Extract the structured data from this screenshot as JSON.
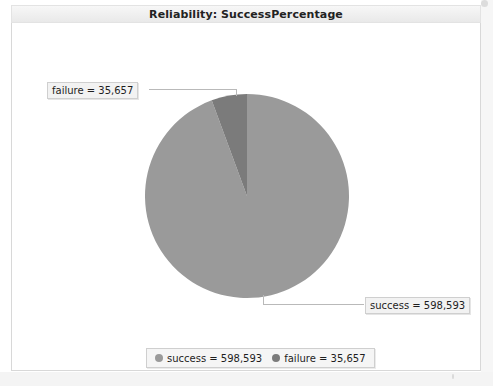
{
  "window": {
    "title": "Reliability: SuccessPercentage"
  },
  "colors": {
    "success": "#9a9a9a",
    "failure": "#7b7b7b",
    "panel_background": "#ffffff",
    "titlebar_background": "#efefef",
    "label_background": "#f2f2f2",
    "label_border": "#cfcfcf",
    "callout_line": "#b9b9b9"
  },
  "labels": {
    "failure_callout": "failure = 35,657",
    "success_callout": "success = 598,593"
  },
  "legend": {
    "items": [
      {
        "label": "success = 598,593",
        "color": "#9a9a9a",
        "name": "success"
      },
      {
        "label": "failure = 35,657",
        "color": "#7b7b7b",
        "name": "failure"
      }
    ]
  },
  "chart_data": {
    "type": "pie",
    "title": "Reliability: SuccessPercentage",
    "categories": [
      "success",
      "failure"
    ],
    "values": [
      598593,
      35657
    ],
    "value_labels": [
      "598,593",
      "35,657"
    ],
    "percentages": [
      94.38,
      5.62
    ],
    "colors": [
      "#9a9a9a",
      "#7b7b7b"
    ],
    "start_angle_deg": 90,
    "direction": "counterclockwise",
    "legend_position": "bottom",
    "grid": false,
    "xlabel": "",
    "ylabel": ""
  }
}
